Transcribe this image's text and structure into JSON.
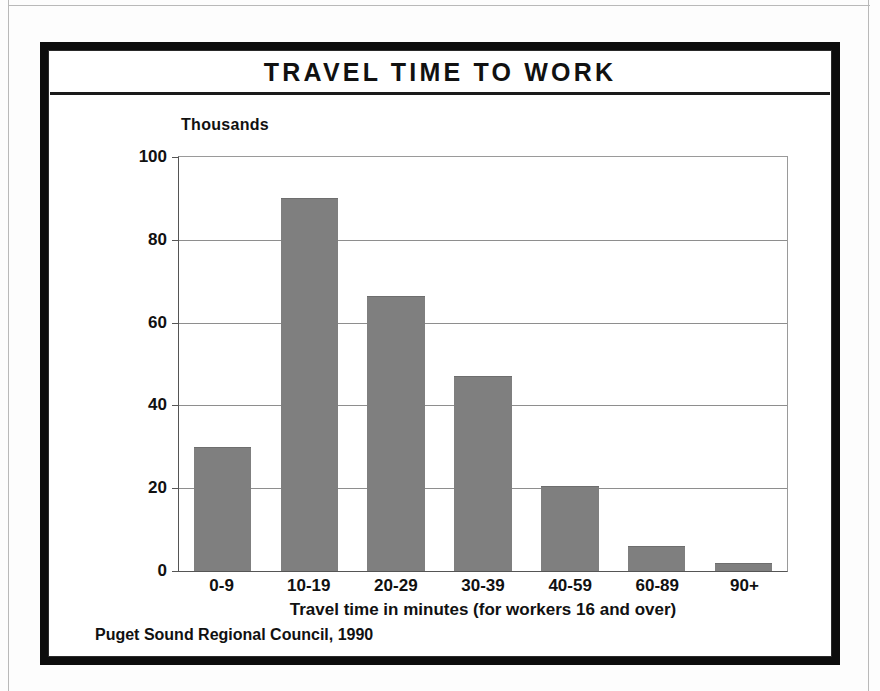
{
  "figure": {
    "title": "TRAVEL TIME TO WORK",
    "units_label": "Thousands",
    "axis_caption": "Travel time in minutes (for workers 16 and over)",
    "source_note": "Puget Sound Regional Council, 1990"
  },
  "colors": {
    "bar_fill": "#7f7f7f",
    "frame": "#0d0d0d",
    "gridline": "#8e8e8e",
    "text": "#111111"
  },
  "chart_data": {
    "type": "bar",
    "title": "TRAVEL TIME TO WORK",
    "subtitle": "",
    "xlabel": "Travel time in minutes (for workers 16 and over)",
    "ylabel": "Thousands",
    "categories": [
      "0-9",
      "10-19",
      "20-29",
      "30-39",
      "40-59",
      "60-89",
      "90+"
    ],
    "values": [
      30,
      90,
      66.5,
      47,
      20.5,
      6,
      2
    ],
    "ylim": [
      0,
      100
    ],
    "yticks": [
      0,
      20,
      40,
      60,
      80,
      100
    ],
    "ytick_labels": [
      "0",
      "20",
      "40",
      "60",
      "80",
      "100"
    ],
    "grid": true,
    "legend": false,
    "source": "Puget Sound Regional Council, 1990"
  }
}
